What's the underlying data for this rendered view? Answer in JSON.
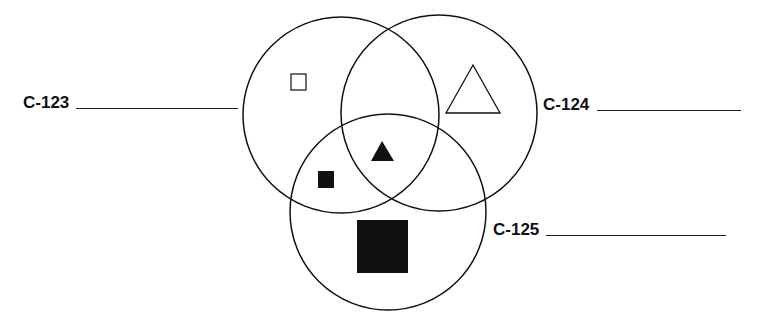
{
  "diagram": {
    "type": "venn",
    "sets": [
      {
        "id": "c123",
        "label": "C-123",
        "circle": {
          "cx": 341,
          "cy": 115,
          "r": 98
        }
      },
      {
        "id": "c124",
        "label": "C-124",
        "circle": {
          "cx": 439,
          "cy": 113,
          "r": 98
        }
      },
      {
        "id": "c125",
        "label": "C-125",
        "circle": {
          "cx": 388,
          "cy": 212,
          "r": 98
        }
      }
    ],
    "shapes": [
      {
        "name": "open-square",
        "region": "C-123 only",
        "fill": "none"
      },
      {
        "name": "open-triangle",
        "region": "C-124 only",
        "fill": "none"
      },
      {
        "name": "filled-triangle",
        "region": "C-123 ∩ C-124 ∩ C-125",
        "fill": "#111111"
      },
      {
        "name": "small-filled-square",
        "region": "C-123 ∩ C-125",
        "fill": "#111111"
      },
      {
        "name": "large-filled-square",
        "region": "C-125 only",
        "fill": "#111111"
      }
    ],
    "colors": {
      "stroke": "#111111",
      "fill": "#111111",
      "background": "#ffffff"
    }
  }
}
